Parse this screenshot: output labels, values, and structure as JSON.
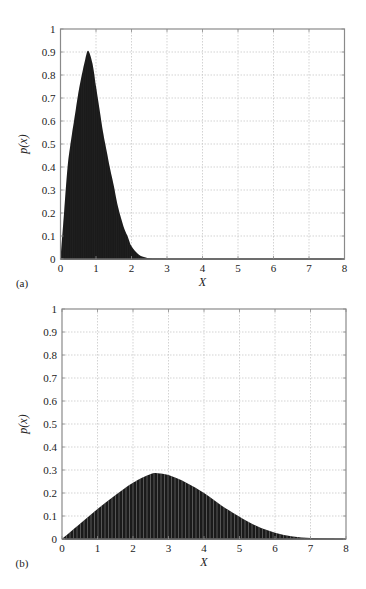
{
  "figure": {
    "panels": [
      {
        "label": "(a)",
        "xlabel": "X",
        "ylabel": "p(x)"
      },
      {
        "label": "(b)",
        "xlabel": "X",
        "ylabel": "p(x)"
      }
    ]
  },
  "colors": {
    "fill": "#1a1a1a",
    "axis": "#8a8a8a",
    "grid": "#c8c8c8",
    "stripe": "#ffffff"
  },
  "chart_data": [
    {
      "type": "area",
      "panel": "(a)",
      "title": "",
      "xlabel": "X",
      "ylabel": "p(x)",
      "xlim": [
        0,
        8
      ],
      "ylim": [
        0,
        1
      ],
      "xticks": [
        0,
        1,
        2,
        3,
        4,
        5,
        6,
        7,
        8
      ],
      "yticks": [
        0,
        0.1,
        0.2,
        0.3,
        0.4,
        0.5,
        0.6,
        0.7,
        0.8,
        0.9,
        1
      ],
      "grid": true,
      "legend": null,
      "x": [
        0,
        0.1,
        0.2,
        0.3,
        0.4,
        0.5,
        0.6,
        0.7,
        0.78,
        0.9,
        1.0,
        1.1,
        1.2,
        1.3,
        1.4,
        1.5,
        1.6,
        1.7,
        1.8,
        1.9,
        2.0,
        2.2,
        2.4,
        2.6,
        3.0,
        8.0
      ],
      "y": [
        0,
        0.2,
        0.4,
        0.52,
        0.62,
        0.72,
        0.8,
        0.87,
        0.905,
        0.85,
        0.75,
        0.65,
        0.55,
        0.47,
        0.39,
        0.32,
        0.24,
        0.18,
        0.13,
        0.095,
        0.055,
        0.02,
        0.007,
        0.002,
        0,
        0
      ]
    },
    {
      "type": "area",
      "panel": "(b)",
      "title": "",
      "xlabel": "X",
      "ylabel": "p(x)",
      "xlim": [
        0,
        8
      ],
      "ylim": [
        0,
        1
      ],
      "xticks": [
        0,
        1,
        2,
        3,
        4,
        5,
        6,
        7,
        8
      ],
      "yticks": [
        0,
        0.1,
        0.2,
        0.3,
        0.4,
        0.5,
        0.6,
        0.7,
        0.8,
        0.9,
        1
      ],
      "grid": true,
      "legend": null,
      "x": [
        0,
        0.5,
        1.0,
        1.5,
        2.0,
        2.5,
        2.7,
        3.0,
        3.5,
        4.0,
        4.5,
        5.0,
        5.5,
        6.0,
        6.5,
        7.0,
        7.5,
        8.0
      ],
      "y": [
        0,
        0.065,
        0.13,
        0.19,
        0.245,
        0.283,
        0.286,
        0.278,
        0.245,
        0.2,
        0.145,
        0.097,
        0.055,
        0.027,
        0.011,
        0.004,
        0.001,
        0
      ]
    }
  ]
}
